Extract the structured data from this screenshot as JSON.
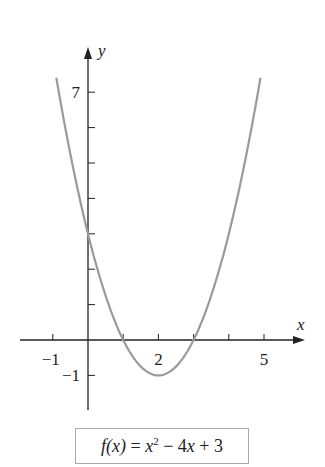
{
  "chart_data": {
    "type": "line",
    "title": "",
    "function": "f(x) = x^2 - 4x + 3",
    "xlabel": "x",
    "ylabel": "y",
    "xlim": [
      -1.9,
      6.2
    ],
    "ylim": [
      -2,
      8.3
    ],
    "x_ticks": [
      -1,
      0,
      1,
      2,
      3,
      4,
      5
    ],
    "x_tick_labels": [
      {
        "value": -1,
        "label": "−1"
      },
      {
        "value": 2,
        "label": "2"
      },
      {
        "value": 5,
        "label": "5"
      }
    ],
    "y_ticks": [
      -1,
      1,
      2,
      3,
      4,
      5,
      6,
      7
    ],
    "y_tick_labels": [
      {
        "value": 7,
        "label": "7"
      },
      {
        "value": -1,
        "label": "−1"
      }
    ],
    "series": [
      {
        "name": "f(x) = x^2 - 4x + 3",
        "x": [
          -0.9,
          -0.5,
          0,
          0.5,
          1,
          1.5,
          2,
          2.5,
          3,
          3.5,
          4,
          4.5,
          4.9
        ],
        "y": [
          7.41,
          5.25,
          3,
          1.25,
          0,
          -0.75,
          -1,
          -0.75,
          0,
          1.25,
          3,
          5.25,
          7.41
        ],
        "color": "#9a9a9a"
      }
    ],
    "grid": false,
    "legend": "none"
  },
  "caption": {
    "lhs": "f(x)",
    "eq": " = ",
    "x": "x",
    "sup": "2",
    "rest1": " − 4",
    "x2": "x",
    "rest2": " + 3"
  },
  "colors": {
    "axis": "#222222",
    "curve": "#9a9a9a",
    "box_border": "#aaaaaa"
  }
}
